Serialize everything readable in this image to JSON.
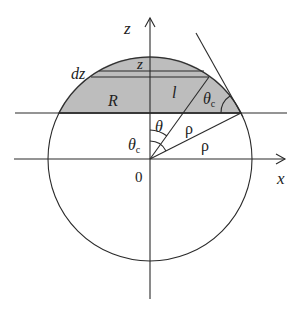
{
  "diagram": {
    "colors": {
      "cap_fill": "#bdbdbd",
      "cap_edge": "#8a8a8a",
      "line": "#2a2a2a",
      "background": "#ffffff"
    },
    "axes": {
      "z_label": "z",
      "x_label": "x",
      "origin_label": "0"
    },
    "labels": {
      "dz": "dz",
      "z_strip": "z",
      "R": "R",
      "l": "l",
      "theta": "θ",
      "theta_c_upper": "θ",
      "theta_c_upper_sub": "c",
      "theta_c_lower": "θ",
      "theta_c_lower_sub": "c",
      "rho_inner": "ρ",
      "rho_outer": "ρ"
    }
  }
}
